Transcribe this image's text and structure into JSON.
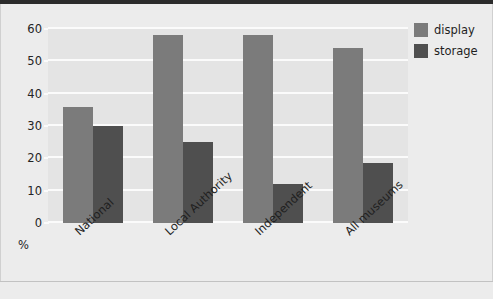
{
  "chart_data": {
    "type": "bar",
    "title": "",
    "xlabel": "",
    "ylabel": "%",
    "ylim": [
      0,
      60
    ],
    "ytick_labels": [
      "60",
      "50",
      "40",
      "30",
      "20",
      "10",
      "0"
    ],
    "ytick_values": [
      60,
      50,
      40,
      30,
      20,
      10,
      0
    ],
    "grid": true,
    "legend_position": "right",
    "categories": [
      "National",
      "Local Authority",
      "Independent",
      "All museums"
    ],
    "series": [
      {
        "name": "display",
        "color": "#7b7b7b",
        "values": [
          36,
          58,
          58,
          54
        ]
      },
      {
        "name": "storage",
        "color": "#4f4f4f",
        "values": [
          30,
          25,
          12,
          18.5
        ]
      }
    ]
  },
  "legend": {
    "items": [
      {
        "label": "display",
        "color": "#7b7b7b"
      },
      {
        "label": "storage",
        "color": "#4f4f4f"
      }
    ]
  },
  "axis": {
    "percent_symbol": "%"
  }
}
